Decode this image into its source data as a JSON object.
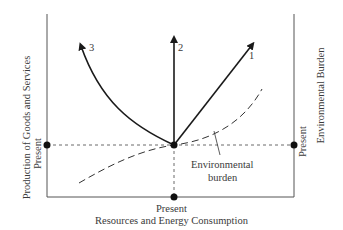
{
  "diagram": {
    "x_axis_label": "Resources and Energy Consumption",
    "y_axis_left_label": "Production of Goods and Services",
    "y_axis_right_label": "Environmental Burden",
    "present_bottom": "Present",
    "present_left": "Present",
    "present_right": "Present",
    "arrows": [
      {
        "id": "1",
        "label": "1"
      },
      {
        "id": "2",
        "label": "2"
      },
      {
        "id": "3",
        "label": "3"
      }
    ],
    "curve_label_line1": "Environmental",
    "curve_label_line2": "burden",
    "colors": {
      "line": "#1a1a1a",
      "text": "#3a3a3a"
    }
  }
}
